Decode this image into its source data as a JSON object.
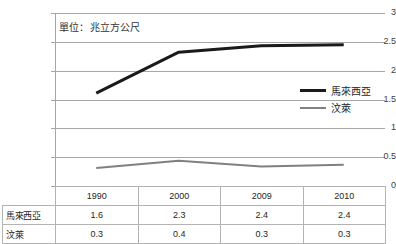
{
  "chart_data": {
    "type": "line",
    "title": "",
    "subtitle": "",
    "annotation": "單位：兆立方公尺",
    "xlabel": "",
    "ylabel": "",
    "categories": [
      "1990",
      "2000",
      "2009",
      "2010"
    ],
    "ylim": [
      0,
      3
    ],
    "yticks": [
      "0",
      "0.5",
      "1",
      "1.5",
      "2",
      "2.5",
      "3"
    ],
    "ytick_values": [
      0,
      0.5,
      1,
      1.5,
      2,
      2.5,
      3
    ],
    "grid": true,
    "legend_position": "right-middle",
    "series": [
      {
        "name": "馬來西亞",
        "color": "#1a1a1a",
        "width": 3,
        "values": [
          1.6,
          2.3,
          2.4,
          2.4
        ],
        "plot_values": [
          1.61,
          2.32,
          2.43,
          2.45
        ]
      },
      {
        "name": "汶萊",
        "color": "#808080",
        "width": 2,
        "values": [
          0.3,
          0.4,
          0.3,
          0.3
        ],
        "plot_values": [
          0.31,
          0.44,
          0.34,
          0.37
        ]
      }
    ]
  },
  "table": {
    "corner": "",
    "columns": [
      "1990",
      "2000",
      "2009",
      "2010"
    ],
    "rows": [
      {
        "label": "馬來西亞",
        "cells": [
          "1.6",
          "2.3",
          "2.4",
          "2.4"
        ]
      },
      {
        "label": "汶萊",
        "cells": [
          "0.3",
          "0.4",
          "0.3",
          "0.3"
        ]
      }
    ]
  },
  "colors": {
    "series_malaysia": "#1a1a1a",
    "series_brunei": "#808080",
    "gridline": "#a6a6a6",
    "table_border": "#b3b3b3",
    "text": "#262626",
    "background": "#ffffff"
  }
}
